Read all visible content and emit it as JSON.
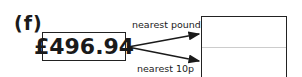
{
  "question": {
    "label": "(f)",
    "value": "£496.94",
    "arrows": [
      {
        "label": "nearest pound"
      },
      {
        "label": "nearest 10p"
      }
    ],
    "answer_boxes": [
      {
        "value": ""
      },
      {
        "value": ""
      }
    ]
  }
}
